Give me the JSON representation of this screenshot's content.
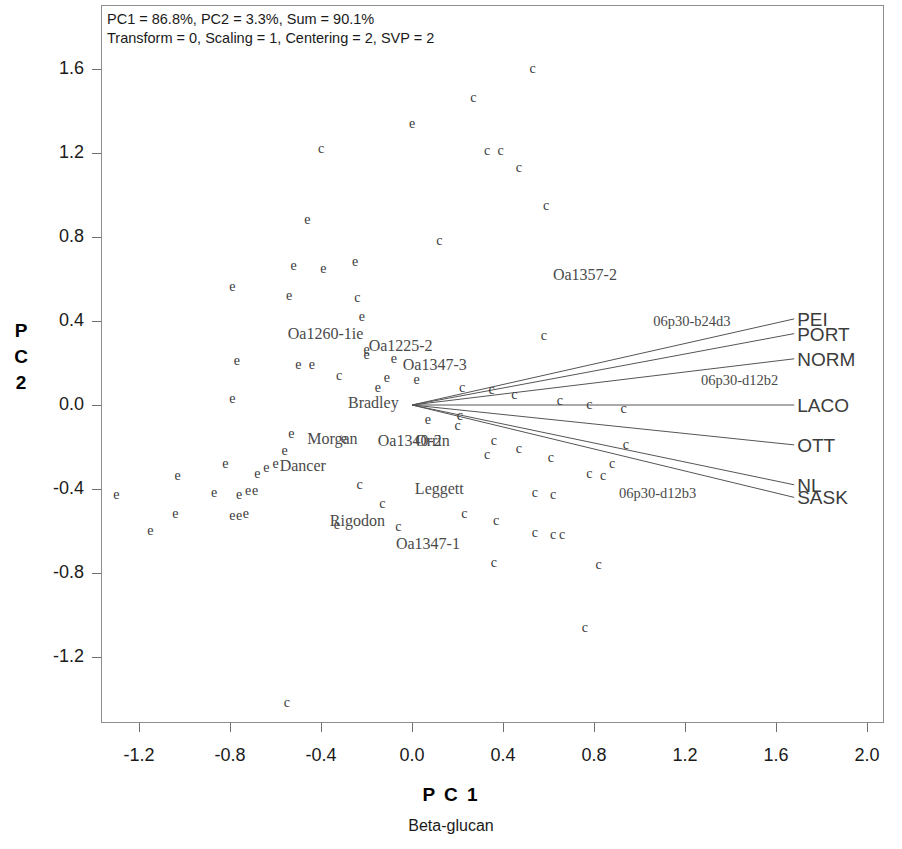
{
  "annotation": {
    "line1": "PC1 = 86.8%, PC2 = 3.3%, Sum = 90.1%",
    "line2": "Transform = 0, Scaling = 1, Centering = 2, SVP = 2"
  },
  "axes": {
    "x_title": "P C 1",
    "x_subtitle": "Beta-glucan",
    "y_title_chars": [
      "P",
      "C",
      "2"
    ]
  },
  "chart_data": {
    "type": "scatter",
    "title": "",
    "subtitle": "Beta-glucan",
    "xlabel": "P C 1",
    "ylabel": "P C 2",
    "xlim": [
      -1.45,
      2.55
    ],
    "ylim": [
      -1.52,
      1.83
    ],
    "grid": false,
    "legend": "none",
    "pc1_variance_pct": 86.8,
    "pc2_variance_pct": 3.3,
    "variance_sum_pct": 90.1,
    "transform": 0,
    "scaling": 1,
    "centering": 2,
    "svp": 2,
    "xticks": [
      "-1.2",
      "-0.8",
      "-0.4",
      "0.0",
      "0.4",
      "0.8",
      "1.2",
      "1.6",
      "2.0",
      "2.4"
    ],
    "xtick_values": [
      -1.2,
      -0.8,
      -0.4,
      0.0,
      0.4,
      0.8,
      1.2,
      1.6,
      2.0,
      2.4
    ],
    "yticks": [
      "1.6",
      "1.2",
      "0.8",
      "0.4",
      "0.0",
      "-0.4",
      "-0.8",
      "-1.2"
    ],
    "ytick_values": [
      1.6,
      1.2,
      0.8,
      0.4,
      0.0,
      -0.4,
      -0.8,
      -1.2
    ],
    "marker_glyphs": [
      "c",
      "e"
    ],
    "points": [
      {
        "g": "c",
        "x": 0.53,
        "y": 1.6
      },
      {
        "g": "c",
        "x": 0.27,
        "y": 1.46
      },
      {
        "g": "e",
        "x": 0.0,
        "y": 1.34
      },
      {
        "g": "c",
        "x": -0.4,
        "y": 1.22
      },
      {
        "g": "c",
        "x": 0.33,
        "y": 1.21
      },
      {
        "g": "c",
        "x": 0.39,
        "y": 1.21
      },
      {
        "g": "c",
        "x": 0.47,
        "y": 1.13
      },
      {
        "g": "c",
        "x": 0.59,
        "y": 0.95
      },
      {
        "g": "e",
        "x": -0.46,
        "y": 0.88
      },
      {
        "g": "c",
        "x": 0.12,
        "y": 0.78
      },
      {
        "g": "e",
        "x": -0.52,
        "y": 0.66
      },
      {
        "g": "e",
        "x": -0.39,
        "y": 0.65
      },
      {
        "g": "e",
        "x": -0.25,
        "y": 0.68
      },
      {
        "g": "e",
        "x": -0.79,
        "y": 0.56
      },
      {
        "g": "e",
        "x": -0.54,
        "y": 0.52
      },
      {
        "g": "c",
        "x": -0.24,
        "y": 0.51
      },
      {
        "g": "e",
        "x": -0.22,
        "y": 0.42
      },
      {
        "g": "c",
        "x": 0.58,
        "y": 0.33
      },
      {
        "g": "e",
        "x": -0.77,
        "y": 0.21
      },
      {
        "g": "e",
        "x": -0.5,
        "y": 0.19
      },
      {
        "g": "e",
        "x": -0.44,
        "y": 0.19
      },
      {
        "g": "e",
        "x": -0.2,
        "y": 0.26
      },
      {
        "g": "e",
        "x": -0.2,
        "y": 0.24
      },
      {
        "g": "e",
        "x": -0.08,
        "y": 0.22
      },
      {
        "g": "c",
        "x": -0.32,
        "y": 0.14
      },
      {
        "g": "e",
        "x": -0.11,
        "y": 0.13
      },
      {
        "g": "e",
        "x": 0.02,
        "y": 0.12
      },
      {
        "g": "e",
        "x": -0.79,
        "y": 0.03
      },
      {
        "g": "e",
        "x": -0.15,
        "y": 0.08
      },
      {
        "g": "c",
        "x": 0.22,
        "y": 0.08
      },
      {
        "g": "c",
        "x": 0.35,
        "y": 0.07
      },
      {
        "g": "c",
        "x": 0.45,
        "y": 0.05
      },
      {
        "g": "c",
        "x": 0.65,
        "y": 0.02
      },
      {
        "g": "c",
        "x": 0.78,
        "y": 0.0
      },
      {
        "g": "c",
        "x": 0.93,
        "y": -0.02
      },
      {
        "g": "e",
        "x": 0.07,
        "y": -0.07
      },
      {
        "g": "c",
        "x": 0.21,
        "y": -0.05
      },
      {
        "g": "c",
        "x": 0.2,
        "y": -0.1
      },
      {
        "g": "e",
        "x": -0.53,
        "y": -0.14
      },
      {
        "g": "c",
        "x": 0.36,
        "y": -0.17
      },
      {
        "g": "e",
        "x": -0.3,
        "y": -0.16
      },
      {
        "g": "e",
        "x": -0.56,
        "y": -0.22
      },
      {
        "g": "c",
        "x": 0.47,
        "y": -0.21
      },
      {
        "g": "c",
        "x": 0.94,
        "y": -0.19
      },
      {
        "g": "c",
        "x": 0.33,
        "y": -0.24
      },
      {
        "g": "c",
        "x": 0.61,
        "y": -0.25
      },
      {
        "g": "c",
        "x": 0.88,
        "y": -0.28
      },
      {
        "g": "e",
        "x": -0.6,
        "y": -0.28
      },
      {
        "g": "e",
        "x": -0.64,
        "y": -0.3
      },
      {
        "g": "e",
        "x": -0.82,
        "y": -0.28
      },
      {
        "g": "e",
        "x": -0.68,
        "y": -0.33
      },
      {
        "g": "c",
        "x": 0.78,
        "y": -0.33
      },
      {
        "g": "c",
        "x": 0.84,
        "y": -0.34
      },
      {
        "g": "e",
        "x": -1.03,
        "y": -0.34
      },
      {
        "g": "e",
        "x": -0.87,
        "y": -0.42
      },
      {
        "g": "c",
        "x": -0.23,
        "y": -0.38
      },
      {
        "g": "e",
        "x": -0.72,
        "y": -0.41
      },
      {
        "g": "e",
        "x": -0.69,
        "y": -0.41
      },
      {
        "g": "e",
        "x": -0.76,
        "y": -0.43
      },
      {
        "g": "e",
        "x": -1.3,
        "y": -0.43
      },
      {
        "g": "c",
        "x": 0.54,
        "y": -0.42
      },
      {
        "g": "c",
        "x": 0.62,
        "y": -0.43
      },
      {
        "g": "c",
        "x": -0.13,
        "y": -0.47
      },
      {
        "g": "e",
        "x": -1.04,
        "y": -0.52
      },
      {
        "g": "e",
        "x": -0.79,
        "y": -0.53
      },
      {
        "g": "e",
        "x": -0.76,
        "y": -0.53
      },
      {
        "g": "e",
        "x": -0.73,
        "y": -0.52
      },
      {
        "g": "c",
        "x": 0.23,
        "y": -0.52
      },
      {
        "g": "c",
        "x": 0.37,
        "y": -0.55
      },
      {
        "g": "e",
        "x": -0.33,
        "y": -0.57
      },
      {
        "g": "c",
        "x": -0.06,
        "y": -0.58
      },
      {
        "g": "e",
        "x": -1.15,
        "y": -0.6
      },
      {
        "g": "c",
        "x": 0.54,
        "y": -0.61
      },
      {
        "g": "c",
        "x": 0.62,
        "y": -0.62
      },
      {
        "g": "c",
        "x": 0.66,
        "y": -0.62
      },
      {
        "g": "c",
        "x": 0.36,
        "y": -0.75
      },
      {
        "g": "c",
        "x": 0.82,
        "y": -0.76
      },
      {
        "g": "c",
        "x": 0.76,
        "y": -1.06
      },
      {
        "g": "c",
        "x": -0.55,
        "y": -1.42
      }
    ],
    "point_labels": [
      {
        "text": "Oa1260-1ie",
        "x": -0.38,
        "y": 0.34
      },
      {
        "text": "Oa1225-2",
        "x": -0.05,
        "y": 0.28
      },
      {
        "text": "Oa1347-3",
        "x": 0.1,
        "y": 0.19
      },
      {
        "text": "Bradley",
        "x": -0.17,
        "y": 0.01
      },
      {
        "text": "Morgan",
        "x": -0.35,
        "y": -0.16
      },
      {
        "text": "Oa1340-2",
        "x": -0.01,
        "y": -0.17
      },
      {
        "text": "Orrin",
        "x": 0.09,
        "y": -0.17
      },
      {
        "text": "Dancer",
        "x": -0.48,
        "y": -0.29
      },
      {
        "text": "Leggett",
        "x": 0.12,
        "y": -0.4
      },
      {
        "text": "Rigodon",
        "x": -0.24,
        "y": -0.55
      },
      {
        "text": "Oa1347-1",
        "x": 0.07,
        "y": -0.66
      },
      {
        "text": "Oa1357-2",
        "x": 0.76,
        "y": 0.62
      },
      {
        "text": "06p30-b24d3",
        "x": 1.23,
        "y": 0.4
      },
      {
        "text": "06p30-d12b2",
        "x": 1.44,
        "y": 0.12
      },
      {
        "text": "06p30-d12b3",
        "x": 1.08,
        "y": -0.42
      }
    ],
    "vectors": [
      {
        "name": "PEI",
        "x": 1.68,
        "y": 0.41
      },
      {
        "name": "PORT",
        "x": 1.68,
        "y": 0.34
      },
      {
        "name": "NORM",
        "x": 1.68,
        "y": 0.22
      },
      {
        "name": "LACO",
        "x": 1.68,
        "y": 0.0
      },
      {
        "name": "OTT",
        "x": 1.68,
        "y": -0.19
      },
      {
        "name": "NL",
        "x": 1.68,
        "y": -0.38
      },
      {
        "name": "SASK",
        "x": 1.68,
        "y": -0.44
      }
    ],
    "vector_origin": {
      "x": 0.0,
      "y": 0.0
    }
  }
}
